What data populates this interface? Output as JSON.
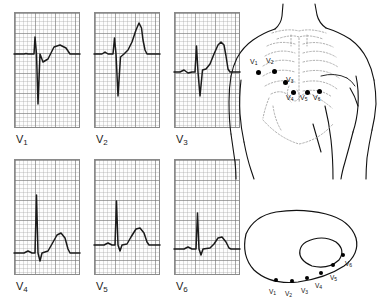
{
  "figure": {
    "type": "medical-illustration"
  },
  "ecg_panels": [
    {
      "label": "V",
      "subscript": "1",
      "x": 14,
      "y": 12,
      "w": 66,
      "h": 116,
      "baseline_y": 42,
      "description": "small r wave, deep S wave, small upright T",
      "path": "M0,42 L10,42 L12,41.5 L14,42 L20,42 L21,25 L22.5,42 L24,92 L26,42 L29,50 L34,47 L40,35 L46,33 L52,36 L56,42 L66,42"
    },
    {
      "label": "V",
      "subscript": "2",
      "x": 94,
      "y": 12,
      "w": 66,
      "h": 116,
      "baseline_y": 42,
      "description": "small r wave, deep S wave, tall peaked T wave",
      "path": "M0,42 L8,42 L11,40 L14,42 L19,42 L20.5,26 L22,42 L24,84 L26.5,45 L30,42 L34,38 L38,30 L42,18 L45,11 L47.5,16 L49,28 L51,38 L53,42 L57,42 L66,42"
    },
    {
      "label": "V",
      "subscript": "3",
      "x": 174,
      "y": 12,
      "w": 66,
      "h": 116,
      "baseline_y": 60,
      "description": "r wave with S wave, broad tall T wave",
      "path": "M0,60 L6,60 L10,58 L14,61 L18,60 L21,60 L22.5,34 L24,60 L26,84 L28.5,58 L32,57 L36,52 L40,42 L44,33 L47,30 L50,33 L52,44 L54,57 L56,60 L66,60"
    },
    {
      "label": "V",
      "subscript": "4",
      "x": 14,
      "y": 159,
      "w": 66,
      "h": 116,
      "baseline_y": 94,
      "description": "tall R wave, small S wave, rounded T wave",
      "path": "M0,94 L10,94 L14,92 L18,94 L21,94 L22.5,36 L24,94 L26,102 L28,94 L34,92 L38,85 L43,76 L47,74 L51,79 L54,90 L56,94 L66,94"
    },
    {
      "label": "V",
      "subscript": "5",
      "x": 94,
      "y": 159,
      "w": 66,
      "h": 116,
      "baseline_y": 86,
      "description": "tall R wave, smaller amplitude than V4, rounded T wave",
      "path": "M0,86 L10,86 L14,84 L18,86 L21,86 L22.5,42 L24,86 L26,92 L28,86 L33,85 L37,78 L42,70 L46,69 L50,74 L53,83 L55,86 L66,86"
    },
    {
      "label": "V",
      "subscript": "6",
      "x": 174,
      "y": 159,
      "w": 66,
      "h": 116,
      "baseline_y": 90,
      "description": "R wave smaller than V5, small rounded T wave",
      "path": "M0,90 L10,90 L14,88 L18,90 L22,90 L23.5,54 L25,90 L27,96 L29,90 L36,89 L40,85 L44,79 L48,78 L52,83 L55,89 L57,90 L66,90"
    }
  ],
  "torso_diagram": {
    "title": "Anterior chest electrode placement",
    "electrodes": [
      {
        "label": "V",
        "subscript": "1",
        "dot_x": 256,
        "dot_y": 70,
        "label_x": 250,
        "label_y": 58
      },
      {
        "label": "V",
        "subscript": "2",
        "dot_x": 272,
        "dot_y": 69,
        "label_x": 266,
        "label_y": 57
      },
      {
        "label": "V",
        "subscript": "3",
        "dot_x": 283,
        "dot_y": 80,
        "label_x": 286,
        "label_y": 76
      },
      {
        "label": "V",
        "subscript": "4",
        "dot_x": 291,
        "dot_y": 90,
        "label_x": 286,
        "label_y": 94
      },
      {
        "label": "V",
        "subscript": "5",
        "dot_x": 305,
        "dot_y": 90,
        "label_x": 300,
        "label_y": 94
      },
      {
        "label": "V",
        "subscript": "6",
        "dot_x": 317,
        "dot_y": 89,
        "label_x": 313,
        "label_y": 94
      }
    ]
  },
  "cross_section_diagram": {
    "title": "Transverse chest section showing electrode positions relative to heart",
    "electrodes": [
      {
        "label": "V",
        "subscript": "1",
        "dot_x": 274,
        "dot_y": 278,
        "label_x": 269,
        "label_y": 288
      },
      {
        "label": "V",
        "subscript": "2",
        "dot_x": 290,
        "dot_y": 279,
        "label_x": 285,
        "label_y": 290
      },
      {
        "label": "V",
        "subscript": "3",
        "dot_x": 305,
        "dot_y": 276,
        "label_x": 301,
        "label_y": 287
      },
      {
        "label": "V",
        "subscript": "4",
        "dot_x": 319,
        "dot_y": 271,
        "label_x": 315,
        "label_y": 282
      },
      {
        "label": "V",
        "subscript": "5",
        "dot_x": 331,
        "dot_y": 263,
        "label_x": 330,
        "label_y": 274
      },
      {
        "label": "V",
        "subscript": "6",
        "dot_x": 341,
        "dot_y": 253,
        "label_x": 345,
        "label_y": 260
      }
    ]
  },
  "colors": {
    "grid_minor": "#aaaaaa",
    "grid_major": "#787878",
    "trace": "#1a1a1a",
    "outline": "#111111",
    "rib_dotted": "#999999",
    "background": "#ffffff"
  }
}
